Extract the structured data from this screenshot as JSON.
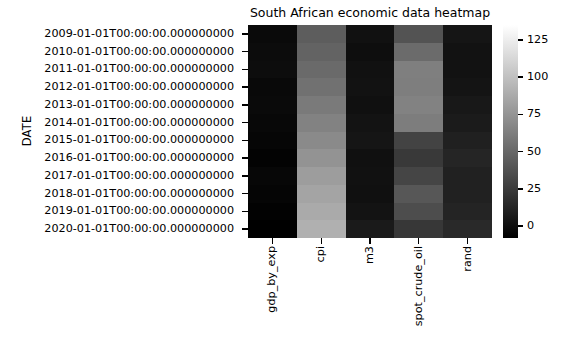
{
  "figure": {
    "background": "#ffffff",
    "width": 564,
    "height": 359
  },
  "title": "South African economic data heatmap",
  "axes": {
    "ylabel": "DATE",
    "xlabel": ""
  },
  "colorbar": {
    "orientation": "vertical",
    "cmap": "gray",
    "vmin": -8,
    "vmax": 135,
    "low_color": "#000000",
    "high_color": "#ffffff",
    "ticks": [
      0,
      25,
      50,
      75,
      100,
      125
    ],
    "tick_labels": [
      "0",
      "25",
      "50",
      "75",
      "100",
      "125"
    ]
  },
  "chart_data": {
    "type": "heatmap",
    "title": "South African economic data heatmap",
    "xlabel": "",
    "ylabel": "DATE",
    "cmap": "gray",
    "vmin": -8,
    "vmax": 135,
    "grid": false,
    "legend": "colorbar-right",
    "columns": [
      "gdp_by_exp",
      "cpi",
      "m3",
      "spot_crude_oil",
      "rand"
    ],
    "rows": [
      "2009-01-01T00:00:00.000000000",
      "2010-01-01T00:00:00.000000000",
      "2011-01-01T00:00:00.000000000",
      "2012-01-01T00:00:00.000000000",
      "2013-01-01T00:00:00.000000000",
      "2014-01-01T00:00:00.000000000",
      "2015-01-01T00:00:00.000000000",
      "2016-01-01T00:00:00.000000000",
      "2017-01-01T00:00:00.000000000",
      "2018-01-01T00:00:00.000000000",
      "2019-01-01T00:00:00.000000000",
      "2020-01-01T00:00:00.000000000"
    ],
    "values": [
      [
        2.5,
        70,
        6.5,
        62,
        8.4
      ],
      [
        3.0,
        74,
        5.0,
        79,
        7.3
      ],
      [
        3.3,
        78,
        6.5,
        95,
        7.3
      ],
      [
        2.2,
        83,
        6.9,
        94,
        8.2
      ],
      [
        2.5,
        88,
        5.8,
        98,
        9.7
      ],
      [
        1.8,
        93,
        7.5,
        93,
        10.9
      ],
      [
        1.2,
        98,
        8.5,
        49,
        12.8
      ],
      [
        0.4,
        104,
        6.2,
        41,
        14.7
      ],
      [
        1.4,
        110,
        6.5,
        51,
        13.3
      ],
      [
        0.8,
        115,
        5.8,
        65,
        13.2
      ],
      [
        0.2,
        119,
        7.4,
        57,
        14.4
      ],
      [
        -6.4,
        123,
        10.8,
        39,
        16.5
      ]
    ],
    "cell_colors": [
      [
        "#0a0a0a",
        "#5d5d5d",
        "#111111",
        "#535353",
        "#151515"
      ],
      [
        "#0c0c0c",
        "#636363",
        "#0e0e0e",
        "#6b6b6b",
        "#121212"
      ],
      [
        "#0d0d0d",
        "#6a6a6a",
        "#111111",
        "#7f7f7f",
        "#121212"
      ],
      [
        "#090909",
        "#717171",
        "#121212",
        "#7e7e7e",
        "#141414"
      ],
      [
        "#0a0a0a",
        "#7a7a7a",
        "#101010",
        "#828282",
        "#181818"
      ],
      [
        "#080808",
        "#828282",
        "#131313",
        "#7d7d7d",
        "#1b1b1b"
      ],
      [
        "#060606",
        "#8a8a8a",
        "#151515",
        "#434343",
        "#202020"
      ],
      [
        "#030303",
        "#939393",
        "#101010",
        "#393939",
        "#252525"
      ],
      [
        "#070707",
        "#9d9d9d",
        "#111111",
        "#454545",
        "#212121"
      ],
      [
        "#050505",
        "#a4a4a4",
        "#101010",
        "#575757",
        "#212121"
      ],
      [
        "#020202",
        "#aaaaaa",
        "#131313",
        "#4d4d4d",
        "#242424"
      ],
      [
        "#000000",
        "#b0b0b0",
        "#1a1a1a",
        "#373737",
        "#292929"
      ]
    ]
  }
}
